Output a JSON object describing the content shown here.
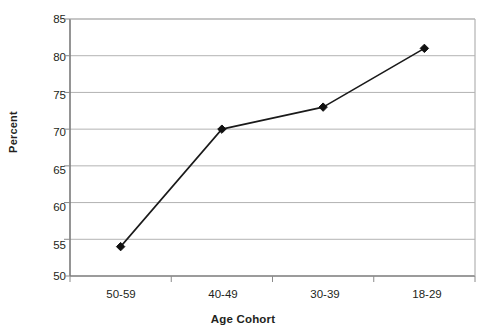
{
  "chart_data": {
    "type": "line",
    "title": "",
    "xlabel": "Age Cohort",
    "ylabel": "Percent",
    "categories": [
      "50-59",
      "40-49",
      "30-39",
      "18-29"
    ],
    "values": [
      54,
      70,
      73,
      81
    ],
    "series": [
      {
        "name": "Percent",
        "values": [
          54,
          70,
          73,
          81
        ]
      }
    ],
    "ylim": [
      50,
      85
    ],
    "yticks": [
      50,
      55,
      60,
      65,
      70,
      75,
      80,
      85
    ],
    "ytick_labels": [
      "50",
      "55",
      "60",
      "65",
      "70",
      "75",
      "80",
      "85"
    ],
    "grid": "horizontal",
    "legend": "none",
    "marker": "diamond",
    "line_color": "#1a1a1a",
    "marker_color": "#111111",
    "grid_color": "#b3b3b3",
    "axis_color": "#808080",
    "background": "#ffffff"
  }
}
